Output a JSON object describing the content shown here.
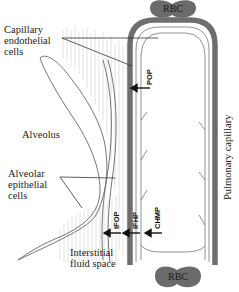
{
  "labels": {
    "capillary_endothelial": [
      "Capillary",
      "endothelial",
      "cells"
    ],
    "alveolus": "Alveolus",
    "alveolar_epithelial": [
      "Alveolar",
      "epithelial",
      "cells"
    ],
    "interstitial": [
      "Interstitial",
      "fluid space"
    ],
    "pulmonary_capillary": "Pulmonary capillary",
    "rbc_top": "RBC",
    "rbc_bottom": "RBC"
  },
  "pressures": {
    "pop": "POP",
    "ifop": "IFOP",
    "ifhp": "IFHP",
    "chmp": "CHMP"
  },
  "colors": {
    "capillary_wall": "#6e6e6e",
    "rbc": "#6b6b6b",
    "line": "#444444",
    "hatch": "#c8c8c8"
  }
}
